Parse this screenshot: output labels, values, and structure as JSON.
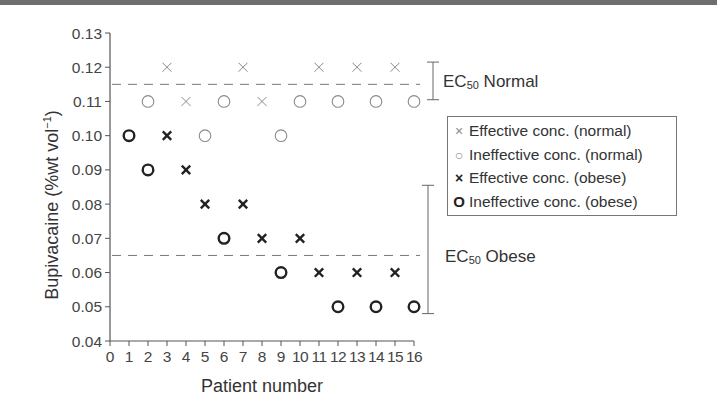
{
  "chart_data": {
    "type": "scatter",
    "title": "",
    "xlabel": "Patient number",
    "ylabel": "Bupivacaine (%wt vol⁻¹)",
    "ylabel_main": "Bupivacaine",
    "ylabel_unit_open": "(%wt vol",
    "ylabel_unit_sup": "−1",
    "ylabel_unit_close": ")",
    "xlim": [
      0,
      16
    ],
    "ylim": [
      0.04,
      0.13
    ],
    "xticks": [
      "0",
      "1",
      "2",
      "3",
      "4",
      "5",
      "6",
      "7",
      "8",
      "9",
      "10",
      "11",
      "12",
      "13",
      "14",
      "15",
      "16"
    ],
    "yticks": [
      "0.04",
      "0.05",
      "0.06",
      "0.07",
      "0.08",
      "0.09",
      "0.10",
      "0.11",
      "0.12",
      "0.13"
    ],
    "grid": false,
    "legend_position": "right",
    "series": [
      {
        "name": "Effective conc. (normal)",
        "marker": "x",
        "color": "#8a8a8a",
        "points": [
          [
            3,
            0.12
          ],
          [
            4,
            0.11
          ],
          [
            7,
            0.12
          ],
          [
            8,
            0.11
          ],
          [
            11,
            0.12
          ],
          [
            13,
            0.12
          ],
          [
            15,
            0.12
          ]
        ]
      },
      {
        "name": "Ineffective conc. (normal)",
        "marker": "o",
        "color": "#8a8a8a",
        "points": [
          [
            2,
            0.11
          ],
          [
            5,
            0.1
          ],
          [
            6,
            0.11
          ],
          [
            9,
            0.1
          ],
          [
            10,
            0.11
          ],
          [
            12,
            0.11
          ],
          [
            14,
            0.11
          ],
          [
            16,
            0.11
          ]
        ]
      },
      {
        "name": "Effective conc. (obese)",
        "marker": "x-bold",
        "color": "#222222",
        "points": [
          [
            3,
            0.1
          ],
          [
            4,
            0.09
          ],
          [
            5,
            0.08
          ],
          [
            7,
            0.08
          ],
          [
            8,
            0.07
          ],
          [
            10,
            0.07
          ],
          [
            11,
            0.06
          ],
          [
            13,
            0.06
          ],
          [
            15,
            0.06
          ]
        ]
      },
      {
        "name": "Ineffective conc. (obese)",
        "marker": "o-bold",
        "color": "#222222",
        "points": [
          [
            1,
            0.1
          ],
          [
            2,
            0.09
          ],
          [
            6,
            0.07
          ],
          [
            9,
            0.06
          ],
          [
            12,
            0.05
          ],
          [
            14,
            0.05
          ],
          [
            16,
            0.05
          ]
        ]
      }
    ],
    "annotations": [
      {
        "type": "hline",
        "y": 0.115,
        "style": "dashed",
        "label": "EC50 Normal",
        "bracket": [
          0.1105,
          0.1215
        ]
      },
      {
        "type": "hline",
        "y": 0.065,
        "style": "dashed",
        "label": "EC50 Obese",
        "bracket": [
          0.048,
          0.0855
        ]
      }
    ]
  },
  "legend": {
    "items": [
      {
        "symbol": "×",
        "label": "Effective conc. (normal)"
      },
      {
        "symbol": "○",
        "label": "Ineffective conc. (normal)"
      },
      {
        "symbol": "×",
        "label": "Effective conc. (obese)"
      },
      {
        "symbol": "O",
        "label": "Ineffective conc. (obese)"
      }
    ]
  },
  "ec50": {
    "normal": {
      "prefix": "EC",
      "sub": "50",
      "suffix": " Normal"
    },
    "obese": {
      "prefix": "EC",
      "sub": "50",
      "suffix": " Obese"
    }
  }
}
